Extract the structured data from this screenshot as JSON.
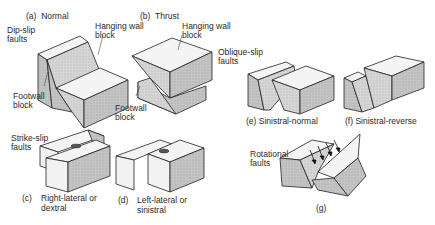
{
  "panels": {
    "a": {
      "letter": "(a)",
      "name": "Normal"
    },
    "b": {
      "letter": "(b)",
      "name": "Thrust"
    },
    "c": {
      "letter": "(c)",
      "name": "Right-lateral or\ndextral"
    },
    "d": {
      "letter": "(d)",
      "name": "Left-lateral or\nsinistral"
    },
    "e": {
      "letter": "(e)",
      "name": "Sinistral-normal"
    },
    "f": {
      "letter": "(f)",
      "name": "Sinistral-reverse"
    },
    "g": {
      "letter": "(g)"
    }
  },
  "groups": {
    "dip_slip": "Dip-slip\nfaults",
    "strike_slip": "Strike-slip\nfaults",
    "oblique_slip": "Oblique-slip\nfaults",
    "rotational": "Rotational\nfaults"
  },
  "annotations": {
    "a_hanging": "Hanging wall\nblock",
    "a_footwall": "Footwall\nblock",
    "b_hanging": "Hanging wall\nblock",
    "b_footwall": "Footwall\nblock"
  },
  "colors": {
    "line": "#222222",
    "top_face": "#f4f4f4",
    "side_face": "#bdbdbd",
    "front_face": "#d2d2d2"
  }
}
